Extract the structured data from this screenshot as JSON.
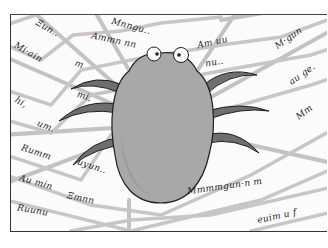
{
  "illustration": {
    "subject": "spider-on-web",
    "colors": {
      "web": "#bdbdbd",
      "body": "#a9a9a9",
      "body_shadow": "#8f8f8f",
      "legs": "#6b6b6b",
      "outline": "#222222",
      "ink": "#1e1e1e",
      "paper": "#fbfbfb"
    },
    "scribbles": [
      {
        "text": "Ξun..",
        "x": 34,
        "y": 22,
        "rot": 30
      },
      {
        "text": "Mnngu..",
        "x": 110,
        "y": 20,
        "rot": 15
      },
      {
        "text": "Ammn nn",
        "x": 90,
        "y": 34,
        "rot": 12
      },
      {
        "text": "Am uu",
        "x": 196,
        "y": 36,
        "rot": -12
      },
      {
        "text": "M·gun",
        "x": 272,
        "y": 32,
        "rot": -35
      },
      {
        "text": "Mi·ain",
        "x": 12,
        "y": 46,
        "rot": 30
      },
      {
        "text": "m",
        "x": 74,
        "y": 58,
        "rot": 20
      },
      {
        "text": "nu..",
        "x": 204,
        "y": 56,
        "rot": -10
      },
      {
        "text": "au ge.",
        "x": 286,
        "y": 68,
        "rot": -35
      },
      {
        "text": "hi,",
        "x": 14,
        "y": 96,
        "rot": 30
      },
      {
        "text": "mi,",
        "x": 76,
        "y": 90,
        "rot": 18
      },
      {
        "text": "Mm",
        "x": 294,
        "y": 106,
        "rot": -38
      },
      {
        "text": "um.",
        "x": 36,
        "y": 120,
        "rot": 22
      },
      {
        "text": "Rumm",
        "x": 20,
        "y": 146,
        "rot": 18
      },
      {
        "text": "uyun..",
        "x": 76,
        "y": 160,
        "rot": 18
      },
      {
        "text": "Au min",
        "x": 18,
        "y": 176,
        "rot": 16
      },
      {
        "text": "Ξmnn",
        "x": 66,
        "y": 192,
        "rot": 12
      },
      {
        "text": "Mmmmgun·n m",
        "x": 186,
        "y": 180,
        "rot": -8
      },
      {
        "text": "Ruunu",
        "x": 16,
        "y": 204,
        "rot": 10
      },
      {
        "text": "euim u f",
        "x": 256,
        "y": 210,
        "rot": -12
      }
    ]
  }
}
